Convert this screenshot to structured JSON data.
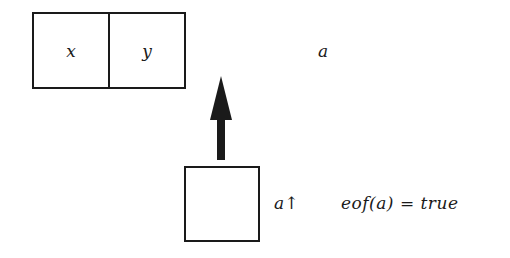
{
  "diagram": {
    "type": "file-buffer-window-diagram",
    "cells": [
      {
        "id": "cell-x",
        "label": "x"
      },
      {
        "id": "cell-y",
        "label": "y"
      }
    ],
    "file_label": "a",
    "buffer_label": "a↑",
    "condition": "eof(a) = true",
    "arrow": {
      "direction": "up",
      "from": "buffer-box",
      "to": "cell-row",
      "color": "#1a1a1a"
    },
    "colors": {
      "stroke": "#1a1a1a",
      "background": "#ffffff"
    }
  }
}
